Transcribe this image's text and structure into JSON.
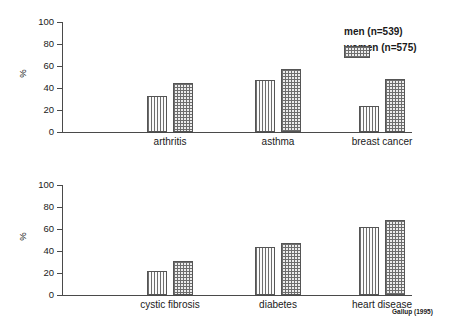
{
  "chart_data": [
    {
      "panel": "top",
      "type": "bar",
      "title": "",
      "xlabel": "",
      "ylabel": "%",
      "ylim": [
        0,
        100
      ],
      "yticks": [
        0,
        20,
        40,
        60,
        80,
        100
      ],
      "grid": false,
      "categories": [
        "arthritis",
        "asthma",
        "breast cancer"
      ],
      "series": [
        {
          "name": "men (n=539)",
          "values": [
            33,
            47,
            24
          ]
        },
        {
          "name": "women (n=575)",
          "values": [
            45,
            57,
            48
          ]
        }
      ]
    },
    {
      "panel": "bottom",
      "type": "bar",
      "title": "",
      "xlabel": "",
      "ylabel": "%",
      "ylim": [
        0,
        100
      ],
      "yticks": [
        0,
        20,
        40,
        60,
        80,
        100
      ],
      "grid": false,
      "categories": [
        "cystic fibrosis",
        "diabetes",
        "heart disease"
      ],
      "series": [
        {
          "name": "men (n=539)",
          "values": [
            22,
            44,
            62
          ]
        },
        {
          "name": "women (n=575)",
          "values": [
            31,
            47,
            68
          ]
        }
      ]
    }
  ],
  "legend": {
    "position": "top-right",
    "entries": [
      {
        "label": "men (n=539)",
        "pattern": "vertical-lines"
      },
      {
        "label": "women (n=575)",
        "pattern": "cross-hatch"
      }
    ]
  },
  "axis": {
    "y_title": "%",
    "tick_labels": [
      "100",
      "80",
      "60",
      "40",
      "20",
      "0"
    ]
  },
  "source_note": "Gallup (1995)",
  "colors": {
    "axis": "#4a4a4a",
    "bar_outline": "#555555",
    "hatch": "#6e6e6e",
    "men_fill": "#f2f2f2",
    "women_fill": "#ededed",
    "text": "#1a1a1a",
    "background": "#ffffff"
  }
}
